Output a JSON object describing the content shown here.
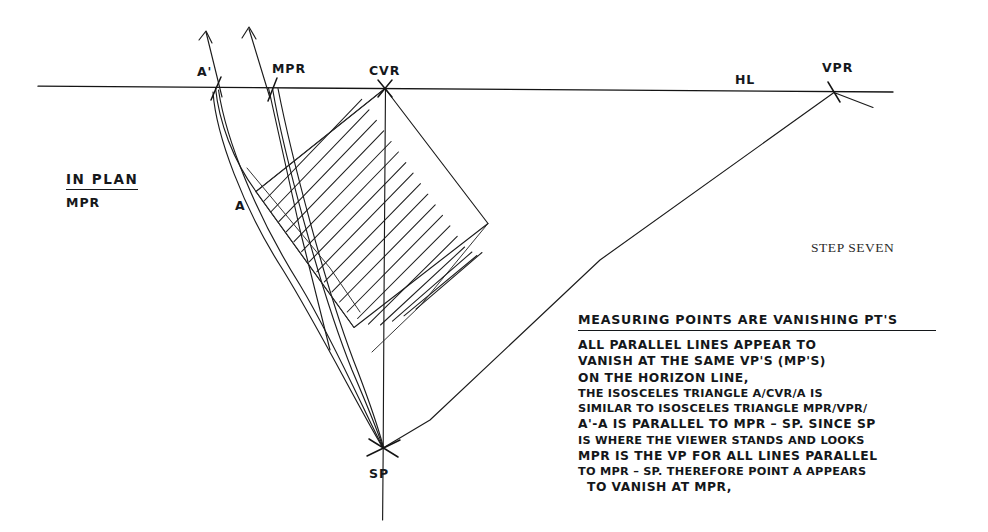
{
  "sheet": {
    "title": "Perspective construction — measuring points",
    "caption": "STEP SEVEN"
  },
  "plan_note": {
    "title": "IN PLAN",
    "subtitle": "MPR"
  },
  "diagram": {
    "horizon_label": "HL",
    "points": [
      {
        "id": "a-prime",
        "label": "A'",
        "x": 215,
        "y": 87
      },
      {
        "id": "mpr",
        "label": "MPR",
        "x": 272,
        "y": 88
      },
      {
        "id": "cvr",
        "label": "CVR",
        "x": 385,
        "y": 88
      },
      {
        "id": "vpr",
        "label": "VPR",
        "x": 834,
        "y": 92
      },
      {
        "id": "a",
        "label": "A",
        "x": 256,
        "y": 192
      },
      {
        "id": "sp",
        "label": "SP",
        "x": 383,
        "y": 448
      }
    ],
    "label_positions": {
      "a_prime": {
        "x": 199,
        "y": 80
      },
      "mpr": {
        "x": 272,
        "y": 74
      },
      "cvr": {
        "x": 370,
        "y": 78
      },
      "hl": {
        "x": 735,
        "y": 86
      },
      "vpr": {
        "x": 823,
        "y": 76
      },
      "a": {
        "x": 236,
        "y": 214
      },
      "sp": {
        "x": 370,
        "y": 482
      }
    }
  },
  "notes": {
    "heading": "MEASURING POINTS ARE VANISHING PT'S",
    "lines": [
      {
        "text": "ALL PARALLEL LINES APPEAR TO",
        "style": "normal"
      },
      {
        "text": "VANISH AT THE SAME VP'S (MP'S)",
        "style": "normal"
      },
      {
        "text": "ON THE HORIZON LINE,",
        "style": "normal"
      },
      {
        "text": "THE ISOSCELES TRIANGLE A/CVR/A IS",
        "style": "compact"
      },
      {
        "text": "SIMILAR TO ISOSCELES TRIANGLE MPR/VPR/",
        "style": "compact"
      },
      {
        "text": "A'-A IS PARALLEL TO MPR – SP. SINCE SP",
        "style": "normal"
      },
      {
        "text": "IS WHERE THE VIEWER STANDS AND LOOKS",
        "style": "compact"
      },
      {
        "text": "MPR IS THE VP FOR ALL LINES PARALLEL",
        "style": "normal"
      },
      {
        "text": "TO MPR – SP. THEREFORE POINT A APPEARS",
        "style": "compact"
      },
      {
        "text": "TO VANISH AT MPR,",
        "style": "indent"
      }
    ]
  },
  "colors": {
    "ink": "#15181c",
    "paper": "#ffffff"
  }
}
